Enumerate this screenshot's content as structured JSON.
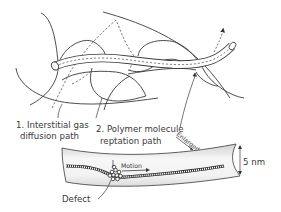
{
  "diagram": {
    "labels": {
      "gas_path_line1": "1. Interstitial gas",
      "gas_path_line2": "diffusion path",
      "reptation_line1": "2. Polymer molecule",
      "reptation_line2": "reptation path",
      "enlarged": "Enlarged",
      "motion": "Motion",
      "defect": "Defect",
      "scale": "5 nm"
    },
    "colors": {
      "line": "#3a3a3a",
      "tube_fill": "#ffffff",
      "dash": "#555555",
      "band_light": "#f6f6f6",
      "band_dark": "#cfcfcf"
    }
  }
}
